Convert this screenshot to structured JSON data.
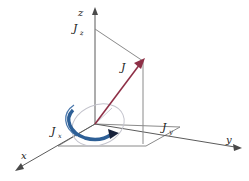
{
  "figure": {
    "background_color": "#ffffff",
    "width": 249,
    "height": 181
  },
  "colors": {
    "axis": "#5b5b5b",
    "projection": "#8a8a8a",
    "vector": "#8e2f46",
    "precession_arc": "#2d5f96",
    "cone": "#c3c3cc",
    "label": "#1a1a1a"
  },
  "axes": [
    {
      "id": "z",
      "label": "z",
      "label_x": 78,
      "label_y": 15,
      "direction": "up",
      "arrowhead": true
    },
    {
      "id": "y",
      "label": "y",
      "label_x": 226,
      "label_y": 143,
      "direction": "right-down",
      "arrowhead": true
    },
    {
      "id": "x",
      "label": "x",
      "label_x": 22,
      "label_y": 159,
      "direction": "left-down",
      "arrowhead": true
    }
  ],
  "vector": {
    "label": "J",
    "label_x": 122,
    "label_y": 70,
    "origin_x": 95,
    "origin_y": 124,
    "tip_x": 143,
    "tip_y": 61,
    "color": "#8e2f46",
    "description": "total angular momentum vector"
  },
  "components": [
    {
      "id": "Jz",
      "base": "J",
      "subscript": "z",
      "label_x": 74,
      "label_y": 32,
      "axis": "z",
      "description": "z-component of angular momentum, constant in time"
    },
    {
      "id": "Jx",
      "base": "J",
      "subscript": "x",
      "label_x": 52,
      "label_y": 135,
      "axis": "x",
      "description": "x-component of angular momentum"
    },
    {
      "id": "Jy",
      "base": "J",
      "subscript": "y",
      "label_x": 163,
      "label_y": 131,
      "axis": "y",
      "description": "y-component of angular momentum"
    }
  ],
  "precession": {
    "label": "",
    "color": "#2d5f96",
    "direction": "counterclockwise-about-z",
    "arrowhead": true,
    "description": "blue arc indicating precession of J about the z-axis"
  },
  "cone": {
    "color": "#c3c3cc",
    "description": "faint precession cone ellipse traced by the vector"
  }
}
